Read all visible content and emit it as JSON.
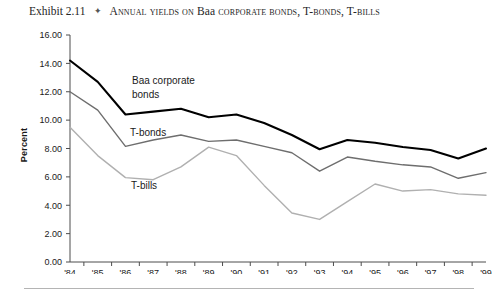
{
  "caption": {
    "exhibit_label": "Exhibit 2.11",
    "separator_icon": "diamond-bullet-icon",
    "separator_glyph": "✦",
    "title_prefix": "Annual yields on ",
    "title_keyword": "Baa",
    "title_suffix": " corporate bonds, T-bonds, T-bills",
    "title_full": "Annual yields on Baa corporate bonds, T-bonds, T-bills"
  },
  "chart_data": {
    "type": "line",
    "title": "Annual yields on Baa corporate bonds, T-bonds, T-bills",
    "xlabel": "",
    "ylabel": "Percent",
    "ylim": [
      0.0,
      16.0
    ],
    "ytick_step": 2.0,
    "ytick_labels": [
      "0.00",
      "2.00",
      "4.00",
      "6.00",
      "8.00",
      "10.00",
      "12.00",
      "14.00",
      "16.00"
    ],
    "ytick_values": [
      0.0,
      2.0,
      4.0,
      6.0,
      8.0,
      10.0,
      12.0,
      14.0,
      16.0
    ],
    "grid": false,
    "legend": "inline-labels",
    "categories": [
      "'84",
      "'85",
      "'86",
      "'87",
      "'88",
      "'89",
      "'90",
      "'91",
      "'92",
      "'93",
      "'94",
      "'95",
      "'96",
      "'97",
      "'98",
      "'99"
    ],
    "x": [
      1984,
      1985,
      1986,
      1987,
      1988,
      1989,
      1990,
      1991,
      1992,
      1993,
      1994,
      1995,
      1996,
      1997,
      1998,
      1999
    ],
    "series": [
      {
        "name": "Baa corporate bonds",
        "label": "Baa corporate bonds",
        "color": "#000000",
        "width": 2.1,
        "values": [
          14.2,
          12.7,
          10.4,
          10.6,
          10.8,
          10.2,
          10.4,
          9.8,
          8.95,
          7.95,
          8.6,
          8.4,
          8.1,
          7.9,
          7.3,
          8.0
        ]
      },
      {
        "name": "T-bonds",
        "label": "T-bonds",
        "color": "#6e6e6e",
        "width": 1.4,
        "values": [
          12.0,
          10.7,
          8.15,
          8.6,
          8.95,
          8.5,
          8.6,
          8.15,
          7.7,
          6.4,
          7.4,
          7.1,
          6.85,
          6.7,
          5.9,
          6.3
        ]
      },
      {
        "name": "T-bills",
        "label": "T-bills",
        "color": "#b0b0b0",
        "width": 1.4,
        "values": [
          9.5,
          7.5,
          5.95,
          5.8,
          6.7,
          8.1,
          7.5,
          5.4,
          3.45,
          3.0,
          4.25,
          5.5,
          5.0,
          5.1,
          4.8,
          4.7
        ]
      }
    ],
    "annotations": [
      {
        "text": "Baa corporate",
        "x_px": 132,
        "y_px": 84
      },
      {
        "text": "bonds",
        "x_px": 132,
        "y_px": 98
      },
      {
        "text": "T-bonds",
        "x_px": 130,
        "y_px": 136
      },
      {
        "text": "T-bills",
        "x_px": 131,
        "y_px": 189
      }
    ]
  }
}
